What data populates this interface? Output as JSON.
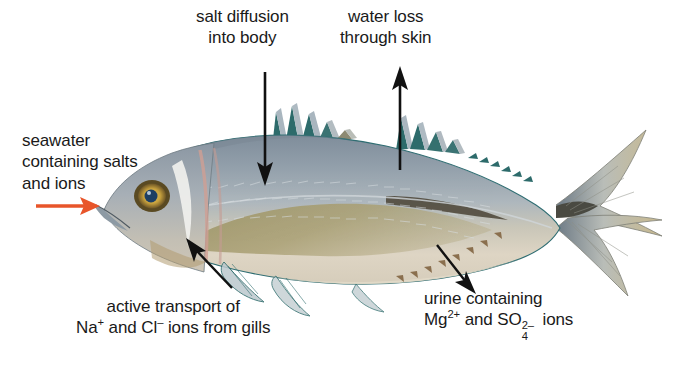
{
  "figure": {
    "background_color": "#ffffff"
  },
  "colors": {
    "text": "#1a1a1a",
    "pointer_arrow": "#e8552a",
    "leader_arrow": "#111111",
    "body_dorsal": "#8e9aa6",
    "body_mid": "#a8b2bb",
    "body_belly": "#ded4c3",
    "lateral_patch": "#a39a6d",
    "fin_membrane": "#2d6b6b",
    "fin_ray": "#9fb0bb",
    "tail_tip": "#c6b68c",
    "eye_iris": "#d8b24a",
    "eye_pupil": "#1d3f63",
    "gill_band": "#cf9f94",
    "outline": "#2f6d72"
  },
  "labels": {
    "salt_diffusion": {
      "name": "salt-diffusion-label",
      "lines": [
        "salt diffusion",
        "into body"
      ],
      "arrow": "down"
    },
    "water_loss": {
      "name": "water-loss-label",
      "lines": [
        "water loss",
        "through skin"
      ],
      "arrow": "up"
    },
    "seawater": {
      "name": "seawater-label",
      "lines": [
        "seawater",
        "containing salts",
        "and ions"
      ],
      "arrow": "right"
    },
    "active_transport": {
      "name": "active-transport-label",
      "line1": "active transport of",
      "ion_sodium": "Na",
      "ion_sodium_charge": "+",
      "conjunction": " and ",
      "ion_chloride": "Cl",
      "ion_chloride_charge": "–",
      "line2_tail": " ions from gills",
      "arrow": "up-left"
    },
    "urine": {
      "name": "urine-label",
      "line1": "urine containing",
      "ion_magnesium": "Mg",
      "ion_magnesium_charge": "2+",
      "conjunction": " and ",
      "ion_sulfate": "SO",
      "ion_sulfate_sub": "4",
      "ion_sulfate_charge": "2–",
      "line2_tail": " ions",
      "arrow": "down-right"
    }
  },
  "arrows": [
    {
      "name": "seawater-intake-arrow",
      "direction": "right",
      "color": "#e8552a"
    },
    {
      "name": "salt-diffusion-arrow",
      "direction": "down",
      "color": "#111111"
    },
    {
      "name": "water-loss-arrow",
      "direction": "up",
      "color": "#111111"
    },
    {
      "name": "active-transport-arrow",
      "direction": "up-left",
      "color": "#111111"
    },
    {
      "name": "urine-excretion-arrow",
      "direction": "down-right",
      "color": "#111111"
    }
  ]
}
